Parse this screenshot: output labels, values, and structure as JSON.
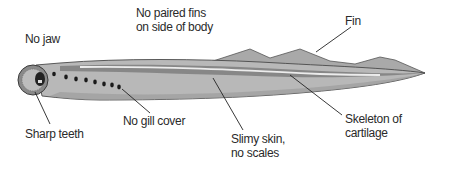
{
  "diagram": {
    "labels": {
      "no_jaw": "No jaw",
      "no_paired_fins_line1": "No paired fins",
      "no_paired_fins_line2": "on side of body",
      "fin": "Fin",
      "sharp_teeth": "Sharp teeth",
      "no_gill_cover": "No gill cover",
      "slimy_skin_line1": "Slimy skin,",
      "slimy_skin_line2": "no scales",
      "skeleton_line1": "Skeleton of",
      "skeleton_line2": "cartilage"
    },
    "colors": {
      "body": "#b4b4b4",
      "body_dark": "#8c8c8c",
      "fin": "#a8a8a8",
      "outline": "#4a4a4a",
      "notochord": "#e6e6e6",
      "leader_line": "#222222",
      "text": "#2a2a2a"
    }
  }
}
